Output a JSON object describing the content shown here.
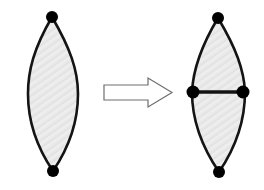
{
  "figure": {
    "background_color": "#ffffff",
    "width": 264,
    "height": 190,
    "stroke_color": "#141414",
    "fill_color": "#e7e7e7",
    "vertex_color": "#000000",
    "arrow_outline_color": "#6e6e6e",
    "arrow_fill_color": "#ffffff"
  },
  "left_shape": {
    "name": "bigon-lens-two-vertices",
    "label": "",
    "vertex_count": 2,
    "edge_count": 2,
    "top_vertex": {
      "x": 52,
      "y": 17,
      "r": 6
    },
    "bottom_vertex": {
      "x": 53,
      "y": 171,
      "r": 6
    },
    "left_extreme_x": 28,
    "right_extreme_x": 78,
    "waist_y": 94,
    "outline_width": 2.6,
    "path": "M 52 17 C 34 48 28 70 28 94 C 28 120 36 146 53 171 C 70 146 78 120 78 94 C 78 70 70 48 52 17 Z"
  },
  "arrow": {
    "name": "block-arrow-right",
    "label": "",
    "direction": "right",
    "x_start": 104,
    "x_end": 172,
    "shaft_top_y": 85,
    "shaft_bottom_y": 100,
    "head_top_y": 78,
    "head_bottom_y": 107,
    "head_start_x": 148,
    "tip_x": 172,
    "outline_width": 1.2,
    "path": "M 104 85 L 148 85 L 148 78 L 172 92.5 L 148 107 L 148 100 L 104 100 Z"
  },
  "right_shape": {
    "name": "bigon-lens-four-vertices-subdivided",
    "label": "",
    "vertex_count": 4,
    "edge_count": 5,
    "top_vertex": {
      "x": 218,
      "y": 18,
      "r": 6
    },
    "bottom_vertex": {
      "x": 219,
      "y": 172,
      "r": 6
    },
    "left_vertex": {
      "x": 193,
      "y": 92,
      "r": 6.5
    },
    "right_vertex": {
      "x": 243,
      "y": 92,
      "r": 6.5
    },
    "left_extreme_x": 192,
    "right_extreme_x": 245,
    "waist_y": 92,
    "outline_width": 2.6,
    "path": "M 218 18 C 200 48 193 70 192 92 C 192 120 202 147 219 172 C 236 147 245 120 245 92 C 244 70 236 48 218 18 Z",
    "subdividing_edge": {
      "x1": 193,
      "y1": 92,
      "x2": 243,
      "y2": 92,
      "width": 3.4
    }
  }
}
